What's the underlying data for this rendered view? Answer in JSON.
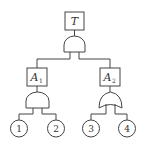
{
  "diagram": {
    "type": "fault-tree",
    "top_event": {
      "label": "T",
      "gate": "AND"
    },
    "intermediate_events": [
      {
        "label": "A",
        "subscript": "1",
        "gate": "AND",
        "children": [
          "1",
          "2"
        ]
      },
      {
        "label": "A",
        "subscript": "2",
        "gate": "OR",
        "children": [
          "3",
          "4"
        ]
      }
    ],
    "basic_events": [
      {
        "label": "1"
      },
      {
        "label": "2"
      },
      {
        "label": "3"
      },
      {
        "label": "4"
      }
    ],
    "colors": {
      "stroke": "#444444",
      "background": "#ffffff"
    }
  }
}
